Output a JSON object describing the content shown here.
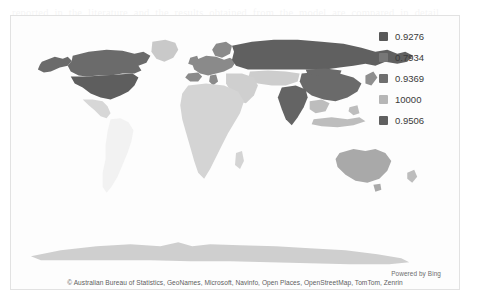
{
  "widget": {
    "name": "filled-map",
    "background": "#fdfdfd",
    "border_color": "#e2e2e2"
  },
  "legend": {
    "position": "top-right",
    "items": [
      {
        "label": "0.9276",
        "color": "#585858"
      },
      {
        "label": "0.7934",
        "color": "#777777"
      },
      {
        "label": "0.9369",
        "color": "#6f6f6f"
      },
      {
        "label": "10000",
        "color": "#b6b6b6"
      },
      {
        "label": "0.9506",
        "color": "#606060"
      }
    ]
  },
  "attribution": {
    "powered_by": "Powered by Bing",
    "copyright": "© Australian Bureau of Statistics, GeoNames, Microsoft, Navinfo, Open Places, OpenStreetMap, TomTom, Zenrin"
  },
  "map": {
    "projection": "web-mercator",
    "regions": [
      {
        "name": "canada",
        "shade": "#6b6b6b"
      },
      {
        "name": "united-states",
        "shade": "#5e5e5e"
      },
      {
        "name": "alaska",
        "shade": "#6b6b6b"
      },
      {
        "name": "greenland",
        "shade": "#c9c9c9"
      },
      {
        "name": "mexico",
        "shade": "#d7d7d7"
      },
      {
        "name": "south-america",
        "shade": "#f2f2f2"
      },
      {
        "name": "europe",
        "shade": "#8a8a8a"
      },
      {
        "name": "africa",
        "shade": "#d4d4d4"
      },
      {
        "name": "russia",
        "shade": "#606060"
      },
      {
        "name": "china",
        "shade": "#6a6a6a"
      },
      {
        "name": "india",
        "shade": "#646464"
      },
      {
        "name": "middle-east",
        "shade": "#cfcfcf"
      },
      {
        "name": "central-asia",
        "shade": "#cdcdcd"
      },
      {
        "name": "southeast-asia",
        "shade": "#bdbdbd"
      },
      {
        "name": "australia",
        "shade": "#a9a9a9"
      },
      {
        "name": "antarctica",
        "shade": "#cfcfcf"
      }
    ]
  },
  "page_bleed": {
    "text": "reported in the literature and the results obtained from the model are compared in detail below. the estimated values show a consistent pattern across the regions examined, and the differences between the observed and predicted series remain within the confidence bounds reported earlier in this section. further discussion of these findings is provided in the following paragraphs together with a summary of limitations."
  }
}
